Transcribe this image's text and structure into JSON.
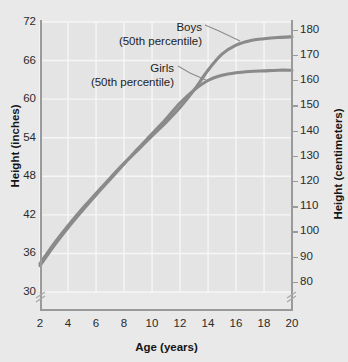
{
  "chart_data": {
    "type": "line",
    "title": "",
    "xlabel": "Age (years)",
    "ylabel": "Height (inches)",
    "ylabel_secondary": "Height (centimeters)",
    "xlim": [
      2,
      20
    ],
    "ylim": [
      30,
      72
    ],
    "ylim_secondary": [
      76,
      183
    ],
    "grid": true,
    "legend_position": "annotations-inline",
    "xticks": [
      2,
      4,
      6,
      8,
      10,
      12,
      14,
      16,
      18,
      20
    ],
    "yticks": [
      30,
      36,
      42,
      48,
      54,
      60,
      66,
      72
    ],
    "yticks_secondary": [
      80,
      90,
      100,
      110,
      120,
      130,
      140,
      150,
      160,
      170,
      180
    ],
    "axis_break_left": true,
    "axis_break_right": true,
    "x": [
      2,
      3,
      4,
      5,
      6,
      7,
      8,
      9,
      10,
      11,
      12,
      13,
      14,
      15,
      16,
      17,
      18,
      19,
      20
    ],
    "series": [
      {
        "name": "Boys",
        "sublabel": "(50th percentile)",
        "color": "#8a8a8a",
        "values": [
          34.4,
          37.5,
          40.3,
          42.9,
          45.3,
          47.7,
          50.0,
          52.1,
          54.3,
          56.4,
          58.7,
          61.4,
          64.5,
          67.0,
          68.4,
          69.1,
          69.4,
          69.6,
          69.7
        ]
      },
      {
        "name": "Girls",
        "sublabel": "(50th percentile)",
        "color": "#8a8a8a",
        "values": [
          34.1,
          37.2,
          40.0,
          42.6,
          45.1,
          47.5,
          49.9,
          52.3,
          54.6,
          56.9,
          59.4,
          61.4,
          62.9,
          63.7,
          64.1,
          64.3,
          64.4,
          64.5,
          64.5
        ]
      }
    ],
    "annotations": [
      {
        "label": "Boys",
        "sublabel": "(50th percentile)",
        "points_to_x": 15.2,
        "points_to_y": 67.3
      },
      {
        "label": "Girls",
        "sublabel": "(50th percentile)",
        "points_to_x": 12.9,
        "points_to_y": 61.2
      }
    ]
  },
  "axes": {
    "left": {
      "title": "Height (inches)",
      "ticks": [
        "72",
        "66",
        "60",
        "54",
        "48",
        "42",
        "36",
        "30"
      ]
    },
    "right": {
      "title": "Height (centimeters)",
      "ticks": [
        "180",
        "170",
        "160",
        "150",
        "140",
        "130",
        "120",
        "110",
        "100",
        "90",
        "80"
      ]
    },
    "bottom": {
      "title": "Age (years)",
      "ticks": [
        "2",
        "4",
        "6",
        "8",
        "10",
        "12",
        "14",
        "16",
        "18",
        "20"
      ]
    }
  },
  "annotations": {
    "boys": {
      "label": "Boys",
      "sublabel": "(50th percentile)"
    },
    "girls": {
      "label": "Girls",
      "sublabel": "(50th percentile)"
    }
  },
  "colors": {
    "background": "#e9e9e9",
    "plot_background": "#e4e4e4",
    "gridline": "#f6f6f6",
    "curve": "#8a8a8a",
    "axis": "#9a9a9a",
    "text": "#1e1e1e"
  }
}
